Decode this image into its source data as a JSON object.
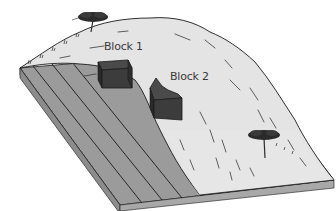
{
  "diagram": {
    "type": "block-diagram",
    "labels": {
      "block1": "Block 1",
      "block2": "Block 2"
    },
    "colors": {
      "background": "#ffffff",
      "deposit_fill": "#e4e4e4",
      "slab_top": "#9b9b9b",
      "slab_front": "#8a8a8a",
      "slab_side": "#a8a8a8",
      "block_dark": "#3c3c3c",
      "block_side": "#2a2a2a",
      "outline": "#1a1a1a",
      "tree": "#2b2b2b"
    },
    "elements": [
      {
        "name": "bedrock-slab",
        "layers": 4
      },
      {
        "name": "sediment-deposit"
      },
      {
        "name": "block-1"
      },
      {
        "name": "block-2"
      },
      {
        "name": "tree-top-left"
      },
      {
        "name": "tree-bottom-right"
      }
    ]
  }
}
